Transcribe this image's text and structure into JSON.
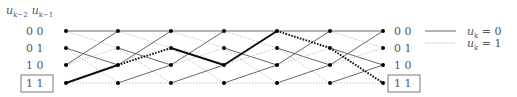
{
  "header": {
    "state_label_a": "u",
    "state_label_a_sub": "k−2",
    "state_label_b": "u",
    "state_label_b_sub": "k−1"
  },
  "states": [
    "0 0",
    "0 1",
    "1 0",
    "1 1"
  ],
  "left_highlighted_state": "1 1",
  "right_highlighted_state": "1 1",
  "legend": [
    {
      "style": "solid",
      "label_var": "u",
      "label_sub": "k",
      "label_rest": " = 0"
    },
    {
      "style": "dotted",
      "label_var": "u",
      "label_sub": "k",
      "label_rest": " = 1"
    }
  ],
  "colors": {
    "solid_line": "#555555",
    "dotted_line": "#b0b0b0",
    "path": "#111111",
    "node": "#000000",
    "text": "#555555"
  },
  "trellis": {
    "columns": 7,
    "column_x": [
      66,
      118,
      171,
      224,
      277,
      330,
      383
    ],
    "row_y": [
      31,
      48,
      65,
      83
    ],
    "transitions": [
      {
        "from": 0,
        "to": 0,
        "input": 0
      },
      {
        "from": 0,
        "to": 1,
        "input": 1
      },
      {
        "from": 1,
        "to": 2,
        "input": 0
      },
      {
        "from": 1,
        "to": 3,
        "input": 1
      },
      {
        "from": 2,
        "to": 0,
        "input": 0
      },
      {
        "from": 2,
        "to": 1,
        "input": 1
      },
      {
        "from": 3,
        "to": 2,
        "input": 0
      },
      {
        "from": 3,
        "to": 3,
        "input": 1
      }
    ],
    "highlighted_path": [
      3,
      2,
      1,
      2,
      0,
      1,
      3
    ]
  }
}
